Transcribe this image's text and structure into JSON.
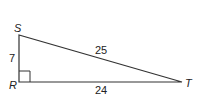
{
  "figure": {
    "type": "right-triangle",
    "vertices": {
      "S": {
        "label": "S",
        "x": 19,
        "y": 35
      },
      "R": {
        "label": "R",
        "x": 19,
        "y": 82
      },
      "T": {
        "label": "T",
        "x": 182,
        "y": 82
      }
    },
    "right_angle_at": "R",
    "sides": {
      "SR": {
        "label": "7"
      },
      "ST": {
        "label": "25"
      },
      "RT": {
        "label": "24"
      }
    },
    "stroke_color": "#333333"
  }
}
